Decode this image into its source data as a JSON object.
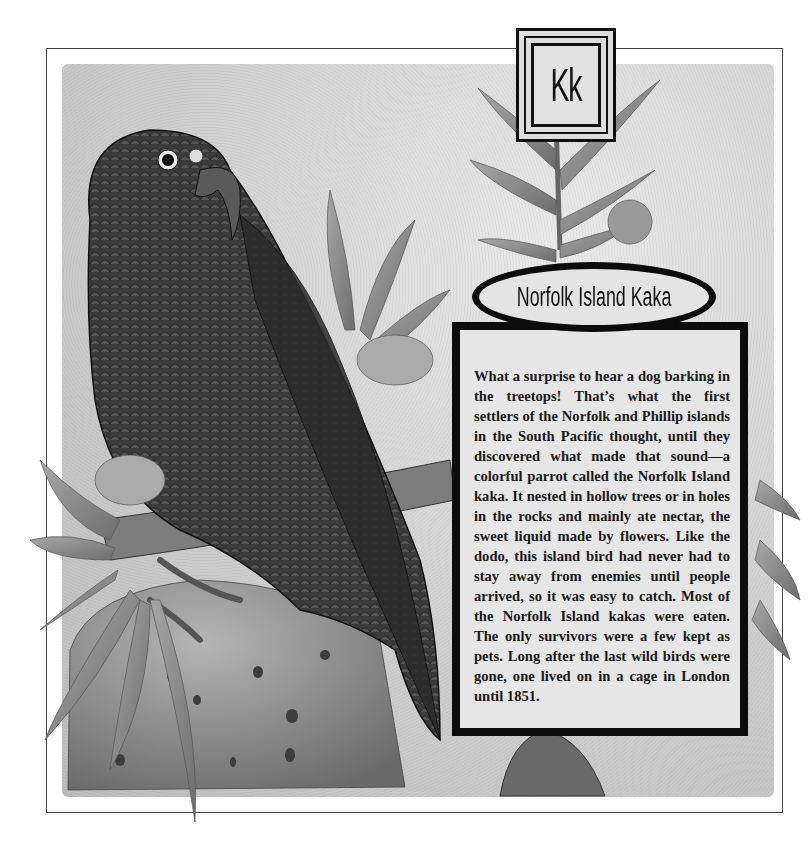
{
  "page": {
    "letter": "Kk",
    "title": "Norfolk Island Kaka",
    "body": "What a surprise to hear a dog barking in the treetops! That’s what the first settlers of the Norfolk and Phillip islands in the South Pacific thought, until they discovered what made that sound—a colorful parrot called the Norfolk Island kaka. It nested in hollow trees or in holes in the rocks and mainly ate nectar, the sweet liquid made by flowers. Like the dodo, this island bird had never had to stay away from enemies until people arrived, so it was easy to catch.  Most of the Norfolk Island kakas were eaten.  The only survivors were a few kept as pets. Long after the last wild birds were gone, one lived on in a cage in London until 1851."
  },
  "illustration": {
    "subject": "parrot-on-rock-with-leaves",
    "palette": {
      "ink": "#111111",
      "mid_gray": "#7a7a7a",
      "leaf_gray": "#8c8c8c",
      "bg_gray": "#d0d0d0"
    }
  }
}
